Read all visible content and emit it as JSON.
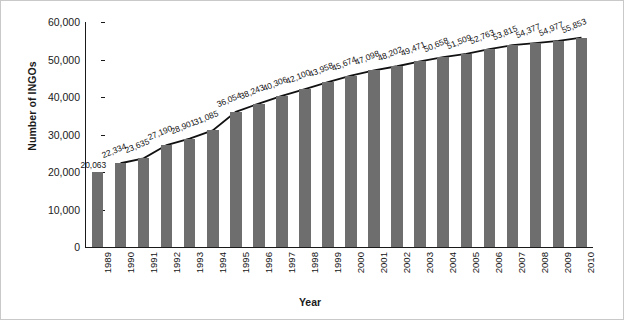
{
  "chart_data": {
    "type": "bar",
    "title": "",
    "xlabel": "Year",
    "ylabel": "Number of INGOs",
    "ylim": [
      0,
      60000
    ],
    "ytick_labels": [
      "0",
      "10,000",
      "20,000",
      "30,000",
      "40,000",
      "50,000",
      "60,000"
    ],
    "ytick_values": [
      0,
      10000,
      20000,
      30000,
      40000,
      50000,
      60000
    ],
    "grid": false,
    "legend": "none",
    "bar_color": "#6e6e6e",
    "line_color": "#111111",
    "categories": [
      "1989",
      "1990",
      "1991",
      "1992",
      "1993",
      "1994",
      "1995",
      "1996",
      "1997",
      "1998",
      "1999",
      "2000",
      "2001",
      "2002",
      "2003",
      "2004",
      "2005",
      "2006",
      "2007",
      "2008",
      "2009",
      "2010"
    ],
    "values": [
      20063,
      22334,
      23635,
      27190,
      28901,
      31085,
      36054,
      38243,
      40306,
      42100,
      43958,
      45674,
      47098,
      48202,
      49471,
      50658,
      51509,
      52763,
      53815,
      54377,
      54977,
      55853
    ],
    "data_labels": [
      "20,063",
      "22,334",
      "23,635",
      "27,190",
      "28,901",
      "31,085",
      "36,054",
      "38,243",
      "40,306",
      "42,100",
      "43,958",
      "45,674",
      "47,098",
      "48,202",
      "49,471",
      "50,658",
      "51,509",
      "52,763",
      "53,815",
      "54,377",
      "54,977",
      "55,853"
    ],
    "series": [
      {
        "name": "Number of INGOs (bars)",
        "type": "bar",
        "values": [
          20063,
          22334,
          23635,
          27190,
          28901,
          31085,
          36054,
          38243,
          40306,
          42100,
          43958,
          45674,
          47098,
          48202,
          49471,
          50658,
          51509,
          52763,
          53815,
          54377,
          54977,
          55853
        ]
      },
      {
        "name": "Trend line",
        "type": "line",
        "starts_at_category": "1990",
        "values": [
          null,
          22334,
          23635,
          27190,
          28901,
          31085,
          36054,
          38243,
          40306,
          42100,
          43958,
          45674,
          47098,
          48202,
          49471,
          50658,
          51509,
          52763,
          53815,
          54377,
          54977,
          55853
        ]
      }
    ],
    "label_rotation_deg": -22,
    "first_label_rotation_deg": 0,
    "xtick_rotation_deg": -90
  }
}
